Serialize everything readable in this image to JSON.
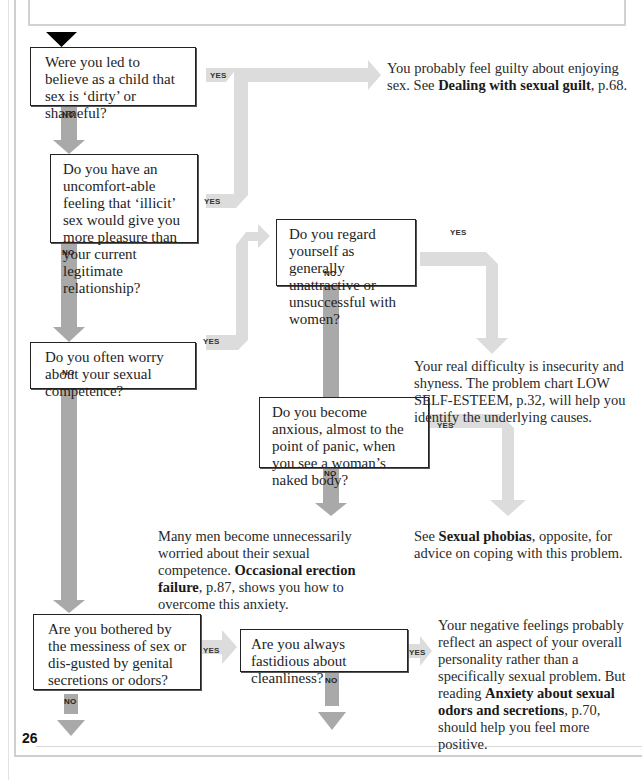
{
  "page": {
    "page_number": "26",
    "colors": {
      "no_arrow": "#a9a9a9",
      "yes_arrow": "#dcdcdc",
      "box_border": "#222222",
      "page_border": "#cfcfcf",
      "start_marker": "#000000"
    }
  },
  "questions": [
    {
      "id": "q1",
      "text": "Were you led to believe as a child that sex is ‘dirty’ or shameful?",
      "yes_label": "YES",
      "no_label": "NO"
    },
    {
      "id": "q2",
      "text": "Do you have an uncomfort-able feeling that ‘illicit’ sex would give you more pleasure than your current legitimate relationship?",
      "yes_label": "YES",
      "no_label": "NO"
    },
    {
      "id": "q3",
      "text": "Do you often worry about your sexual competence?",
      "yes_label": "YES",
      "no_label": "NO"
    },
    {
      "id": "q4",
      "text": "Do you regard yourself as generally unattractive or unsuccessful with women?",
      "yes_label": "YES",
      "no_label": "NO"
    },
    {
      "id": "q5",
      "text": "Do you become anxious, almost to the point of panic, when you see a woman’s naked body?",
      "yes_label": "YES",
      "no_label": "NO"
    },
    {
      "id": "q6",
      "text": "Are you bothered by the messiness of sex or dis-gusted by genital secretions or odors?",
      "yes_label": "YES",
      "no_label": "NO"
    },
    {
      "id": "q7",
      "text": "Are you always fastidious about cleanliness?",
      "yes_label": "YES",
      "no_label": "NO"
    }
  ],
  "answers": [
    {
      "id": "a1",
      "pre": "You probably feel guilty about enjoying sex. See ",
      "bold": "Dealing with sexual guilt",
      "post": ", p.68."
    },
    {
      "id": "a2",
      "pre": "Your real difficulty is insecurity and shyness. The problem chart LOW SELF-ESTEEM, p.32, will help you identify the underlying causes.",
      "bold": "",
      "post": ""
    },
    {
      "id": "a3",
      "pre": "Many men become unnecessarily worried about their sexual competence. ",
      "bold": "Occasional erection failure",
      "post": ", p.87, shows you how to overcome this anxiety."
    },
    {
      "id": "a4",
      "pre": "See ",
      "bold": "Sexual phobias",
      "post": ", opposite, for advice on coping with this problem."
    },
    {
      "id": "a5",
      "pre": "Your negative feelings probably reflect an aspect of your overall personality rather than a specifically sexual problem. But reading ",
      "bold": "Anxiety about sexual odors and secretions",
      "post": ", p.70, should help you feel more positive."
    }
  ]
}
